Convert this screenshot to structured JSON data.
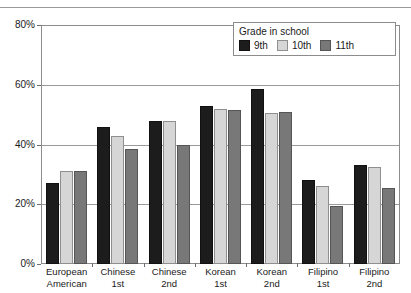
{
  "chart_data": {
    "type": "bar",
    "title": "",
    "xlabel": "",
    "ylabel": "",
    "ylim": [
      0,
      80
    ],
    "yticks": [
      0,
      20,
      40,
      60,
      80
    ],
    "ytick_labels": [
      "0%",
      "20%",
      "40%",
      "60%",
      "80%"
    ],
    "grid": true,
    "legend_position": "top-right",
    "legend_title": "Grade in school",
    "categories": [
      "European American",
      "Chinese 1st",
      "Chinese 2nd",
      "Korean 1st",
      "Korean 2nd",
      "Filipino 1st",
      "Filipino 2nd"
    ],
    "category_lines": [
      [
        "European",
        "American"
      ],
      [
        "Chinese",
        "1st"
      ],
      [
        "Chinese",
        "2nd"
      ],
      [
        "Korean",
        "1st"
      ],
      [
        "Korean",
        "2nd"
      ],
      [
        "Filipino",
        "1st"
      ],
      [
        "Filipino",
        "2nd"
      ]
    ],
    "series": [
      {
        "name": "9th",
        "color": "#1c1c1c",
        "values": [
          27,
          46,
          48,
          53,
          58.5,
          28,
          33
        ]
      },
      {
        "name": "10th",
        "color": "#d6d6d6",
        "values": [
          31,
          43,
          48,
          52,
          50.5,
          26,
          32.5
        ]
      },
      {
        "name": "11th",
        "color": "#787878",
        "values": [
          31,
          38.5,
          40,
          51.5,
          51,
          19.5,
          25.5
        ]
      }
    ]
  },
  "legend": {
    "title": "Grade in school",
    "items": [
      {
        "label": "9th"
      },
      {
        "label": "10th"
      },
      {
        "label": "11th"
      }
    ]
  }
}
